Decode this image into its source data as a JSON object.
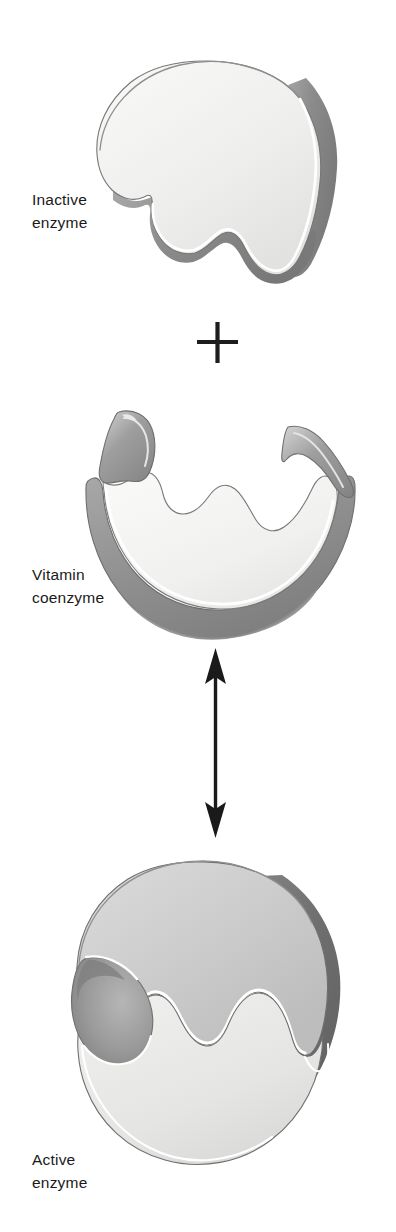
{
  "figure": {
    "kind": "biology-diagram",
    "topic": "Vitamin coenzyme activating an enzyme",
    "background_color": "#ffffff"
  },
  "labels": {
    "inactive_enzyme": {
      "line1": "Inactive",
      "line2": "enzyme"
    },
    "vitamin_coenzyme": {
      "line1": "Vitamin",
      "line2": "coenzyme"
    },
    "active_enzyme": {
      "line1": "Active",
      "line2": "enzyme"
    }
  },
  "operators": {
    "plus": "+",
    "double_arrow": "↕"
  },
  "shapes": [
    {
      "id": "inactive-enzyme",
      "name": "Inactive enzyme",
      "description": "Dome-shaped protein blob with an undulating notched lower edge",
      "fill": "#efefee",
      "shadow": "#8d8d8d",
      "highlight": "#ffffff",
      "outline": "#6a6a6a"
    },
    {
      "id": "vitamin-coenzyme",
      "name": "Vitamin coenzyme",
      "description": "Bowl-shaped molecule with a wavy upper rim complementary to the enzyme",
      "fill": "#f2f1f0",
      "shadow": "#919191",
      "highlight": "#ffffff",
      "outline": "#6a6a6a"
    },
    {
      "id": "active-enzyme",
      "name": "Active enzyme",
      "description": "Enzyme and coenzyme fused into a rounded mass with a crescent notch at left",
      "fill_upper": "#cccccc",
      "fill_lower": "#e7e7e6",
      "shadow": "#6f6f6f",
      "highlight": "#ffffff",
      "outline": "#6a6a6a"
    }
  ],
  "colors": {
    "ink": "#1a1a1a",
    "paper": "#ffffff",
    "light_gray": "#cccccc",
    "mid_gray": "#8d8d8d",
    "dark_gray": "#6f6f6f",
    "near_white": "#efefee"
  }
}
